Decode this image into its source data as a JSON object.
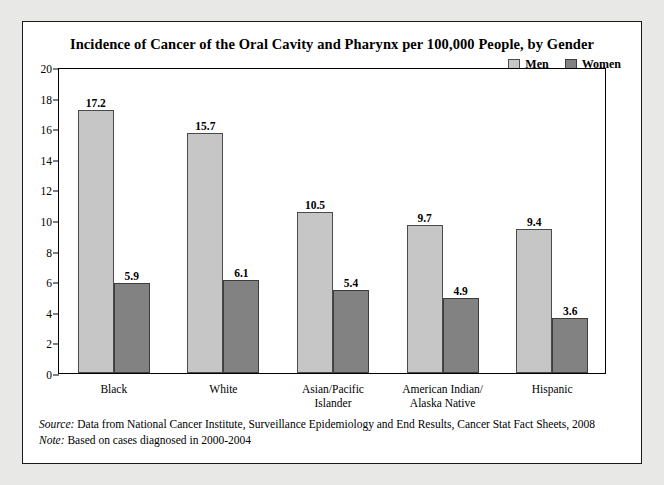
{
  "chart_data": {
    "type": "bar",
    "title": "Incidence of Cancer of the Oral Cavity and Pharynx per 100,000 People, by Gender",
    "xlabel": "",
    "ylabel": "",
    "ylim": [
      0,
      20
    ],
    "ytick_step": 2,
    "yticks": [
      "0",
      "2",
      "4",
      "6",
      "8",
      "10",
      "12",
      "14",
      "16",
      "18",
      "20"
    ],
    "grid": false,
    "legend_position": "top-right",
    "categories": [
      "Black",
      "White",
      "Asian/Pacific Islander",
      "American Indian/ Alaska Native",
      "Hispanic"
    ],
    "category_lines": [
      [
        "Black"
      ],
      [
        "White"
      ],
      [
        "Asian/Pacific",
        "Islander"
      ],
      [
        "American Indian/",
        "Alaska Native"
      ],
      [
        "Hispanic"
      ]
    ],
    "series": [
      {
        "name": "Men",
        "color": "#c6c6c6",
        "values": [
          17.2,
          15.7,
          10.5,
          9.7,
          9.4
        ],
        "labels": [
          "17.2",
          "15.7",
          "10.5",
          "9.7",
          "9.4"
        ]
      },
      {
        "name": "Women",
        "color": "#828282",
        "values": [
          5.9,
          6.1,
          5.4,
          4.9,
          3.6
        ],
        "labels": [
          "5.9",
          "6.1",
          "5.4",
          "4.9",
          "3.6"
        ]
      }
    ]
  },
  "footnotes": [
    {
      "key": "Source:",
      "text": " Data from National Cancer Institute, Surveillance Epidemiology and End Results, Cancer Stat Fact Sheets, 2008"
    },
    {
      "key": "Note:",
      "text": " Based on cases diagnosed in 2000-2004"
    }
  ],
  "colors": {
    "men": "#c6c6c6",
    "women": "#828282",
    "frame": "#1a1a1a",
    "page_background": "#e8e8e6",
    "figure_background": "#ffffff"
  }
}
